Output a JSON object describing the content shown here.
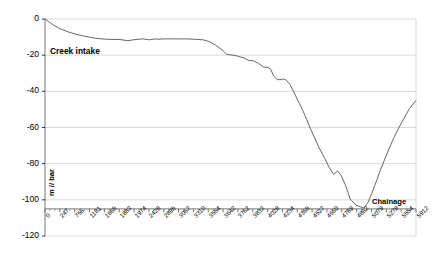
{
  "chart_data": {
    "type": "line",
    "title": "",
    "xlabel": "Chainage",
    "ylabel": "m // bar",
    "xlim": [
      0,
      5912
    ],
    "ylim": [
      -120,
      0
    ],
    "grid": false,
    "legend": "none",
    "annotations": [
      {
        "text": "Creek intake",
        "x": 300,
        "y": -18
      }
    ],
    "y_ticks": [
      "0",
      "-20",
      "-40",
      "-60",
      "-80",
      "-100",
      "-120"
    ],
    "y_tick_values": [
      0,
      -20,
      -40,
      -60,
      -80,
      -100,
      -120
    ],
    "categories": [
      "0",
      "247",
      "756",
      "1181",
      "1665",
      "1883",
      "1974",
      "2428",
      "2895",
      "3067",
      "3310",
      "3554",
      "3642",
      "3762",
      "3833",
      "4028",
      "4234",
      "4365",
      "4527",
      "4660",
      "4789",
      "4862",
      "5079",
      "5278",
      "5554",
      "5912"
    ],
    "series": [
      {
        "name": "Pressure profile",
        "color": "#555555",
        "x": [
          0,
          60,
          140,
          247,
          400,
          560,
          700,
          756,
          900,
          1040,
          1181,
          1320,
          1450,
          1560,
          1665,
          1760,
          1820,
          1883,
          1974,
          2080,
          2180,
          2280,
          2380,
          2428,
          2520,
          2620,
          2720,
          2820,
          2895,
          2990,
          3067,
          3170,
          3250,
          3310,
          3400,
          3480,
          3554,
          3600,
          3642,
          3700,
          3762,
          3800,
          3833,
          3900,
          3960,
          4028,
          4100,
          4170,
          4234,
          4300,
          4365,
          4450,
          4527,
          4600,
          4660,
          4720,
          4789,
          4830,
          4862,
          4960,
          5079,
          5140,
          5200,
          5278,
          5340,
          5420,
          5480,
          5554,
          5640,
          5720,
          5800,
          5912
        ],
        "y": [
          0,
          -1.5,
          -3.5,
          -5.5,
          -7.5,
          -9.0,
          -10.0,
          -10.4,
          -11.0,
          -11.3,
          -11.3,
          -12.0,
          -11.3,
          -11.0,
          -11.5,
          -11.0,
          -11.2,
          -11.0,
          -11.0,
          -11.0,
          -11.0,
          -11.0,
          -11.2,
          -11.3,
          -11.5,
          -12.5,
          -14.5,
          -17.0,
          -19.5,
          -20.0,
          -20.5,
          -21.5,
          -23.0,
          -23.0,
          -24.5,
          -26.5,
          -26.8,
          -28.0,
          -31.5,
          -33.5,
          -33.5,
          -33.2,
          -33.5,
          -36.0,
          -40.0,
          -45.0,
          -50.0,
          -55.5,
          -61.0,
          -66.0,
          -71.0,
          -76.5,
          -82.0,
          -86.0,
          -84.0,
          -86.5,
          -92.0,
          -96.0,
          -99.5,
          -103.0,
          -104.5,
          -102.0,
          -97.0,
          -90.0,
          -84.0,
          -77.0,
          -72.0,
          -66.0,
          -60.0,
          -55.0,
          -50.0,
          -45.0
        ]
      }
    ]
  },
  "plot": {
    "left_px": 45,
    "right_px": 416,
    "top_px": 19,
    "bottom_px": 236,
    "y_top_value": 0,
    "y_bottom_value": -120
  },
  "axis_titles": {
    "x": "Chainage",
    "y": "m // bar"
  }
}
